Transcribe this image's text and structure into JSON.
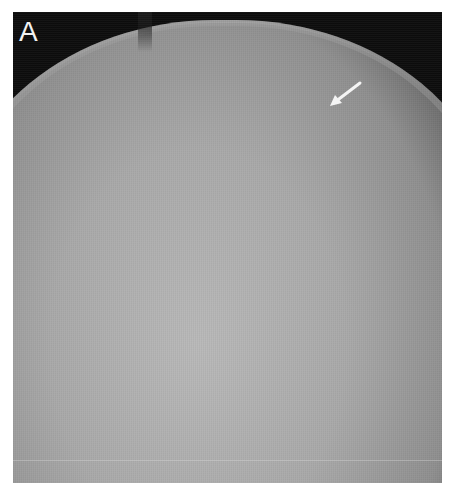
{
  "figure": {
    "panel_label": "A",
    "annotations": [
      {
        "type": "arrow",
        "color": "#ffffff",
        "direction": "down-left",
        "position": "upper-right skull margin"
      }
    ],
    "colors": {
      "background": "#0d0d0d",
      "bone_light": "#b9b9b9",
      "page": "#ffffff"
    }
  }
}
